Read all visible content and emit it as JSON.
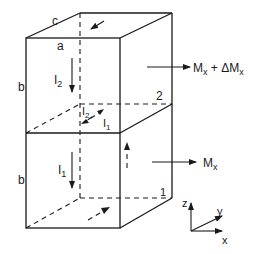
{
  "diagram": {
    "edge_labels": {
      "a": "a",
      "b_top": "b",
      "b_bottom": "b",
      "c": "c"
    },
    "currents": {
      "upper": "I",
      "upper_sub": "2",
      "lower": "I",
      "lower_sub": "1",
      "mid_upper": "I",
      "mid_upper_sub": "2",
      "mid_lower": "I",
      "mid_lower_sub": "1"
    },
    "cell_labels": {
      "upper_cell": "2",
      "lower_cell": "1"
    },
    "moments": {
      "upper": {
        "main": "M",
        "sub": "x",
        "plus": " + ΔM",
        "sub2": "x"
      },
      "lower": {
        "main": "M",
        "sub": "x"
      }
    },
    "axes": {
      "x": "x",
      "y": "y",
      "z": "z"
    }
  }
}
